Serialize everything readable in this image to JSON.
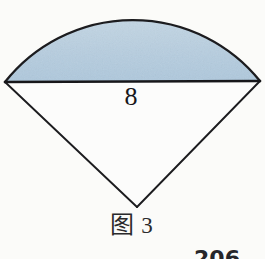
{
  "figure": {
    "name": "circular-sector-with-shaded-segment",
    "caption_label": "图",
    "caption_number": "3",
    "chord_length_label": "8",
    "page_number_partial": "206",
    "colors": {
      "segment_fill": "#b9cfdf",
      "outline": "#1c1c1f",
      "background": "#fbfbf9",
      "text": "#17171a"
    },
    "geometry": {
      "chord_left_x": 5,
      "chord_left_y": 82,
      "chord_right_x": 260,
      "chord_right_y": 81,
      "apex_x": 137,
      "apex_y": 207,
      "arc_top_y": 23,
      "chord_stroke_width": 2.6,
      "radius_stroke_width": 1.8,
      "arc_stroke_width": 2.2
    }
  }
}
